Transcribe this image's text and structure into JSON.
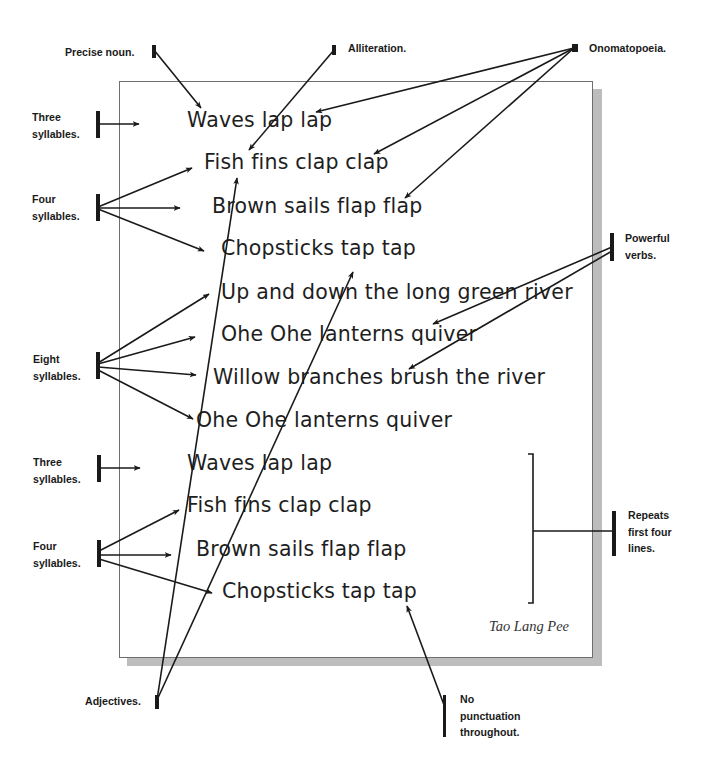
{
  "poem": {
    "lines": [
      {
        "text": "Waves lap lap",
        "x": 187,
        "y": 108
      },
      {
        "text": "Fish fins clap clap",
        "x": 204,
        "y": 150
      },
      {
        "text": "Brown sails flap flap",
        "x": 212,
        "y": 194
      },
      {
        "text": "Chopsticks tap tap",
        "x": 221,
        "y": 236
      },
      {
        "text": "Up and down the long green river",
        "x": 221,
        "y": 280
      },
      {
        "text": "Ohe Ohe lanterns quiver",
        "x": 221,
        "y": 322
      },
      {
        "text": "Willow branches brush the river",
        "x": 213,
        "y": 365
      },
      {
        "text": "Ohe Ohe lanterns quiver",
        "x": 196,
        "y": 408
      },
      {
        "text": "Waves lap lap",
        "x": 187,
        "y": 451
      },
      {
        "text": "Fish fins clap clap",
        "x": 187,
        "y": 493
      },
      {
        "text": "Brown sails flap flap",
        "x": 196,
        "y": 537
      },
      {
        "text": "Chopsticks tap tap",
        "x": 222,
        "y": 579
      }
    ],
    "author": "Tao Lang Pee"
  },
  "annotations": {
    "precise_noun": "Precise noun.",
    "alliteration": "Alliteration.",
    "onomatopoeia": "Onomatopoeia.",
    "three_syllables_1": "Three\nsyllables.",
    "four_syllables_1": "Four\nsyllables.",
    "eight_syllables": "Eight\nsyllables.",
    "three_syllables_2": "Three\nsyllables.",
    "four_syllables_2": "Four\nsyllables.",
    "powerful_verbs": "Powerful\nverbs.",
    "repeats": "Repeats\nfirst four\nlines.",
    "adjectives": "Adjectives.",
    "no_punctuation": "No\npunctuation\nthroughout."
  },
  "colors": {
    "ink": "#1a1a1a",
    "paper_border": "#6e6e6e",
    "paper_shadow": "#bdbdbd"
  }
}
